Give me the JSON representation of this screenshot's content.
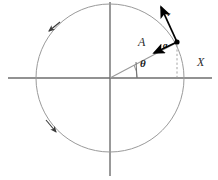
{
  "figure": {
    "background_color": "#ffffff",
    "stroke_color_thin": "#8c8c8c",
    "stroke_color_axis": "#6e6e6e",
    "stroke_color_vector": "#000000"
  },
  "labels": {
    "amplitude": "A",
    "angle": "θ",
    "axis_x": "X",
    "acceleration": "a",
    "velocity": "v"
  },
  "geometry": {
    "center_x": 110,
    "center_y": 78,
    "radius": 74,
    "point_x": 177,
    "point_y": 42,
    "theta_degrees": 28,
    "rotation_sense": "counterclockwise",
    "x_axis_start_x": 8,
    "x_axis_end_x": 212,
    "y_axis_top_y": 2,
    "y_axis_bottom_y": 176,
    "velocity_tip_x": 160,
    "velocity_tip_y": 4,
    "acceleration_tip_x": 152,
    "acceleration_tip_y": 54,
    "dashed_drop_x": 177,
    "dashed_drop_top_y": 44,
    "dashed_drop_bottom_y": 78
  },
  "label_positions": {
    "amplitude": {
      "x": 140,
      "y": 44
    },
    "angle": {
      "x": 141,
      "y": 65
    },
    "axis_x": {
      "x": 199,
      "y": 62
    },
    "acceleration": {
      "x": 164,
      "y": 46
    },
    "velocity": {
      "x": 168,
      "y": 15
    }
  },
  "markers": {
    "circle_direction_arrows": [
      {
        "name": "upper-left-direction-arrow",
        "x": 51,
        "y": 29,
        "angle_deg": 205
      },
      {
        "name": "lower-left-direction-arrow",
        "x": 51,
        "y": 129,
        "angle_deg": 115
      }
    ]
  }
}
